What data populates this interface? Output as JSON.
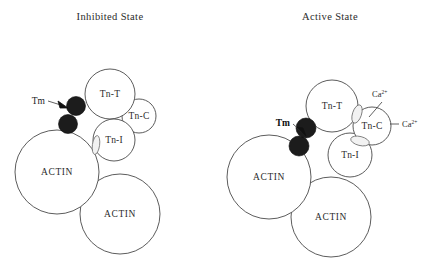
{
  "figure": {
    "background_color": "#ffffff",
    "outline_color": "#4a4a4a",
    "tm_color": "#1c1c1c",
    "text_color": "#2b2b2b",
    "width": 429,
    "height": 272
  },
  "panels": [
    {
      "id": "inhibited",
      "title": "Inhibited State",
      "title_x": 110,
      "title_y": 20,
      "nodes": [
        {
          "name": "tn-t",
          "label": "Tn-T",
          "cx": 110,
          "cy": 94,
          "r": 25,
          "label_dy": 3.2
        },
        {
          "name": "tn-c",
          "label": "Tn-C",
          "cx": 139,
          "cy": 116,
          "r": 17,
          "label_dy": 3.2
        },
        {
          "name": "tn-i",
          "label": "Tn-I",
          "cx": 114,
          "cy": 140,
          "r": 21,
          "label_dy": 3.2
        },
        {
          "name": "actin-upper",
          "label": "ACTIN",
          "cx": 57,
          "cy": 172,
          "r": 42,
          "label_dy": 3.2
        },
        {
          "name": "actin-lower",
          "label": "ACTIN",
          "cx": 120,
          "cy": 214,
          "r": 40,
          "label_dy": 3.2
        }
      ],
      "tm_blobs": [
        {
          "name": "tm-blob-upper",
          "cx": 76,
          "cy": 106,
          "r": 9.5
        },
        {
          "name": "tm-blob-lower",
          "cx": 68,
          "cy": 124,
          "r": 9.5
        }
      ],
      "lenses": [
        {
          "name": "lens-tn-i-actin",
          "cx": 96,
          "cy": 145,
          "rx": 3.6,
          "ry": 9.5,
          "rotate": 8
        }
      ],
      "tm_label": {
        "text": "Tm",
        "x": 31,
        "y": 101
      },
      "tm_arrow": {
        "x1": 47,
        "y1": 101,
        "x2": 66,
        "y2": 106
      }
    },
    {
      "id": "active",
      "title": "Active State",
      "title_x": 330,
      "title_y": 20,
      "nodes": [
        {
          "name": "tn-t",
          "label": "Tn-T",
          "cx": 332,
          "cy": 106,
          "r": 26,
          "label_dy": 3.2
        },
        {
          "name": "tn-c",
          "label": "Tn-C",
          "cx": 372,
          "cy": 126,
          "r": 19,
          "label_dy": 3.2
        },
        {
          "name": "tn-i",
          "label": "Tn-I",
          "cx": 350,
          "cy": 155,
          "r": 22,
          "label_dy": 3.2
        },
        {
          "name": "actin-upper",
          "label": "ACTIN",
          "cx": 269,
          "cy": 177,
          "r": 42,
          "label_dy": 3.2
        },
        {
          "name": "actin-lower",
          "label": "ACTIN",
          "cx": 331,
          "cy": 217,
          "r": 40,
          "label_dy": 3.2
        }
      ],
      "tm_blobs": [
        {
          "name": "tm-blob-upper",
          "cx": 306,
          "cy": 128,
          "r": 10
        },
        {
          "name": "tm-blob-lower",
          "cx": 299,
          "cy": 146,
          "r": 10
        }
      ],
      "lenses": [
        {
          "name": "lens-tn-t-tn-c-upper",
          "cx": 357,
          "cy": 114,
          "rx": 4.5,
          "ry": 9.5,
          "rotate": 18
        },
        {
          "name": "lens-tn-c-tn-i-lower",
          "cx": 360,
          "cy": 141,
          "rx": 9.5,
          "ry": 4.5,
          "rotate": 14
        }
      ],
      "tm_label": {
        "text": "Tm",
        "x": 276,
        "y": 123
      },
      "tm_arrow": {
        "x1": 292,
        "y1": 123,
        "x2": 297,
        "y2": 135
      },
      "ions": [
        {
          "name": "ca-ion-top",
          "base": "Ca",
          "superscript": "2+",
          "x": 380,
          "y": 98,
          "leader": {
            "x1": 382,
            "y1": 102,
            "x2": 369,
            "y2": 117
          }
        },
        {
          "name": "ca-ion-right",
          "base": "Ca",
          "superscript": "2+",
          "x": 404,
          "y": 127,
          "leader": {
            "x1": 400,
            "y1": 124,
            "x2": 389,
            "y2": 124
          }
        }
      ]
    }
  ]
}
